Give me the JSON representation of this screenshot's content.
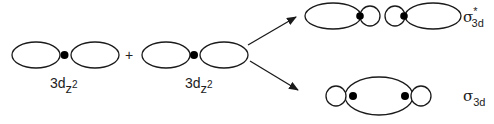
{
  "diagram": {
    "operator": "+",
    "left_orbital": {
      "base": "3d",
      "subscript": "z",
      "superscript": "2"
    },
    "right_orbital": {
      "base": "3d",
      "subscript": "z",
      "superscript": "2"
    },
    "antibonding": {
      "symbol": "σ",
      "star": "*",
      "subscript": "3d"
    },
    "bonding": {
      "symbol": "σ",
      "subscript": "3d"
    },
    "colors": {
      "stroke": "#1a1a1a",
      "fill": "#ffffff",
      "nucleus": "#000000"
    }
  }
}
